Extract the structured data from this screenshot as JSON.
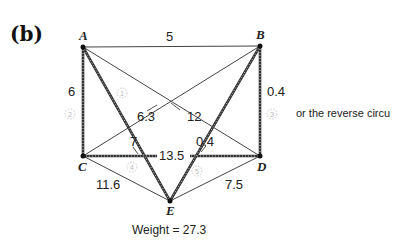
{
  "panel_label": "(b)",
  "graph": {
    "vertices": [
      {
        "id": "A",
        "x": 83,
        "y": 47
      },
      {
        "id": "B",
        "x": 260,
        "y": 46
      },
      {
        "id": "C",
        "x": 83,
        "y": 156
      },
      {
        "id": "D",
        "x": 260,
        "y": 156
      },
      {
        "id": "E",
        "x": 170,
        "y": 201
      }
    ],
    "edges": [
      {
        "from": "A",
        "to": "B",
        "weight": "5",
        "in_circuit": false
      },
      {
        "from": "A",
        "to": "C",
        "weight": "6",
        "in_circuit": true
      },
      {
        "from": "A",
        "to": "D",
        "weight": "12",
        "in_circuit": false
      },
      {
        "from": "A",
        "to": "E",
        "weight": "7",
        "in_circuit": true
      },
      {
        "from": "B",
        "to": "C",
        "weight": "6.3",
        "in_circuit": false
      },
      {
        "from": "B",
        "to": "D",
        "weight": "0.4",
        "in_circuit": true
      },
      {
        "from": "B",
        "to": "E",
        "weight": "0.4",
        "in_circuit": true
      },
      {
        "from": "C",
        "to": "D",
        "weight": "13.5",
        "in_circuit": true
      },
      {
        "from": "C",
        "to": "E",
        "weight": "11.6",
        "in_circuit": false
      },
      {
        "from": "D",
        "to": "E",
        "weight": "7.5",
        "in_circuit": false
      }
    ],
    "step_markers": [
      "1",
      "2",
      "3",
      "4",
      "5"
    ]
  },
  "labels": {
    "A": "A",
    "B": "B",
    "C": "C",
    "D": "D",
    "E": "E",
    "w_AB": "5",
    "w_AC": "6",
    "w_AD": "12",
    "w_AE": "7",
    "w_BC": "6.3",
    "w_BD": "0.4",
    "w_BE": "0.4",
    "w_CD": "13.5",
    "w_CE": "11.6",
    "w_DE": "7.5"
  },
  "side_note": "or the reverse circu",
  "weight_text": "Weight = 27.3"
}
